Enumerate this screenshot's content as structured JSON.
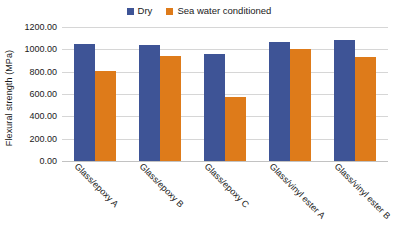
{
  "chart_data": {
    "type": "bar",
    "title": "",
    "xlabel": "",
    "ylabel": "Flexural strength (MPa)",
    "ylim": [
      0,
      1200
    ],
    "ytick_interval": 200,
    "ytick_labels": [
      "1200.00",
      "1000.00",
      "800.00",
      "600.00",
      "400.00",
      "200.00",
      "0.00"
    ],
    "ytick_values": [
      1200,
      1000,
      800,
      600,
      400,
      200,
      0
    ],
    "grid": true,
    "legend_position": "top-center",
    "categories": [
      "Glass/epoxy A",
      "Glass/epoxy B",
      "Glass/epoxy C",
      "Glass/vinyl ester A",
      "Glass/vinyl ester B"
    ],
    "series": [
      {
        "name": "Dry",
        "color": "#3E5496",
        "values": [
          1045,
          1040,
          955,
          1070,
          1085
        ]
      },
      {
        "name": "Sea water conditioned",
        "color": "#DE7B1A",
        "values": [
          803,
          940,
          570,
          1000,
          935
        ]
      }
    ]
  },
  "legend": {
    "entries": [
      {
        "label": "Dry",
        "color": "#3E5496"
      },
      {
        "label": "Sea water conditioned",
        "color": "#DE7B1A"
      }
    ]
  },
  "colors": {
    "series_dry": "#3E5496",
    "series_sea_water": "#DE7B1A",
    "gridline": "#d6d6d6",
    "background": "#ffffff",
    "text": "#1a1a1a"
  }
}
